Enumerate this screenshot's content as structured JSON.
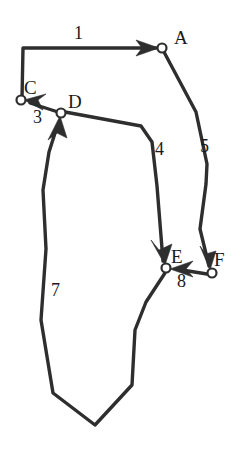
{
  "figure": {
    "type": "directed-graph-diagram",
    "background_color": "#ffffff",
    "stroke_color": "#2e2e2e",
    "text_color": "#1a1a1a",
    "width": 240,
    "height": 458,
    "nodes": [
      {
        "id": "A",
        "label": "A",
        "cx": 162,
        "cy": 48,
        "r": 4.5,
        "label_x": 174,
        "label_y": 28
      },
      {
        "id": "C",
        "label": "C",
        "cx": 21,
        "cy": 100,
        "r": 4.5,
        "label_x": 24,
        "label_y": 78
      },
      {
        "id": "D",
        "label": "D",
        "cx": 61,
        "cy": 113,
        "r": 4.5,
        "label_x": 68,
        "label_y": 92
      },
      {
        "id": "E",
        "label": "E",
        "cx": 166,
        "cy": 268,
        "r": 4.5,
        "label_x": 171,
        "label_y": 247
      },
      {
        "id": "F",
        "label": "F",
        "cx": 212,
        "cy": 273,
        "r": 4.5,
        "label_x": 214,
        "label_y": 250
      }
    ],
    "edges": [
      {
        "id": "1",
        "label": "1",
        "from": "C",
        "to": "A",
        "label_x": 74,
        "label_y": 24
      },
      {
        "id": "3",
        "label": "3",
        "from": "D",
        "to": "C",
        "label_x": 33,
        "label_y": 108
      },
      {
        "id": "4",
        "label": "4",
        "from": "D",
        "to": "E",
        "label_x": 155,
        "label_y": 140
      },
      {
        "id": "5",
        "label": "5",
        "from": "A",
        "to": "F",
        "label_x": 200,
        "label_y": 137
      },
      {
        "id": "7",
        "label": "7",
        "from": "E",
        "to": "D",
        "label_x": 51,
        "label_y": 281
      },
      {
        "id": "8",
        "label": "8",
        "from": "F",
        "to": "E",
        "label_x": 177,
        "label_y": 272
      }
    ]
  }
}
